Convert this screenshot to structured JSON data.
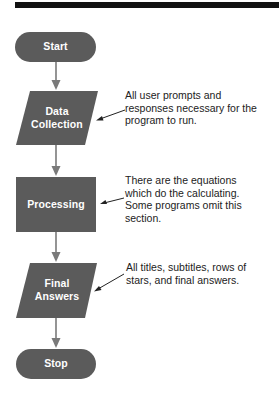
{
  "colors": {
    "shape_fill": "#5b5b5b",
    "connector": "#7a7a7a",
    "topbar": "#111111",
    "annotation_text": "#222222",
    "shape_text": "#ffffff"
  },
  "flowchart": {
    "nodes": [
      {
        "id": "start",
        "type": "terminator",
        "label": "Start"
      },
      {
        "id": "data_collection",
        "type": "input-output",
        "label_lines": [
          "Data",
          "Collection"
        ]
      },
      {
        "id": "processing",
        "type": "process",
        "label": "Processing"
      },
      {
        "id": "final_answers",
        "type": "input-output",
        "label_lines": [
          "Final",
          "Answers"
        ]
      },
      {
        "id": "stop",
        "type": "terminator",
        "label": "Stop"
      }
    ],
    "edges": [
      {
        "from": "start",
        "to": "data_collection"
      },
      {
        "from": "data_collection",
        "to": "processing"
      },
      {
        "from": "processing",
        "to": "final_answers"
      },
      {
        "from": "final_answers",
        "to": "stop"
      }
    ],
    "annotations": [
      {
        "target": "data_collection",
        "lines": [
          "All user prompts and",
          "responses necessary for the",
          "program to run."
        ]
      },
      {
        "target": "processing",
        "lines": [
          "There are the equations",
          "which do the calculating.",
          "Some programs omit this",
          "section."
        ]
      },
      {
        "target": "final_answers",
        "lines": [
          "All titles, subtitles, rows of",
          "stars, and final answers."
        ]
      }
    ]
  }
}
